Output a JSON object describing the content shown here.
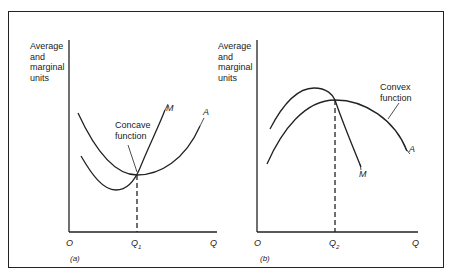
{
  "figure": {
    "panel_a": {
      "caption": "(a)",
      "y_axis_label": [
        "Average",
        "and",
        "marginal",
        "units"
      ],
      "x_axis_origin": "O",
      "x_axis_tick": "Q",
      "x_axis_tick_sub": "1",
      "x_axis_end": "Q",
      "curve_labels": {
        "marginal": "M",
        "average": "A"
      },
      "annotation": [
        "Concave",
        "function"
      ]
    },
    "panel_b": {
      "caption": "(b)",
      "y_axis_label": [
        "Average",
        "and",
        "marginal",
        "units"
      ],
      "x_axis_origin": "O",
      "x_axis_tick": "Q",
      "x_axis_tick_sub": "2",
      "x_axis_end": "Q",
      "curve_labels": {
        "marginal": "M",
        "average": "A"
      },
      "annotation": [
        "Convex",
        "function"
      ]
    }
  },
  "colors": {
    "line": "#222222",
    "background": "#ffffff"
  }
}
